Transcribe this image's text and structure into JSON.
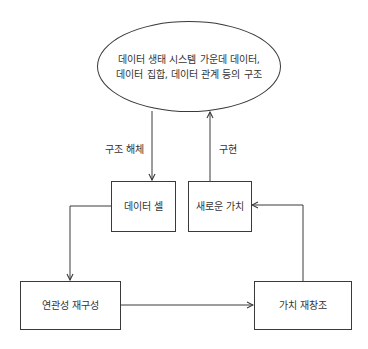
{
  "diagram": {
    "type": "flow",
    "nodes": {
      "ecosystem": {
        "shape": "ellipse",
        "line1": "데이터 생태 시스템 가운데 데이터,",
        "line2": "데이터 집합, 데이터 관계 등의 구조"
      },
      "data_cell": {
        "shape": "rect",
        "label": "데이터 셀"
      },
      "new_value": {
        "shape": "rect",
        "label": "새로운 가치"
      },
      "reconstruct": {
        "shape": "rect",
        "label": "연관성 재구성"
      },
      "value_recreate": {
        "shape": "rect",
        "label": "가치 재창조"
      }
    },
    "edges": [
      {
        "from": "ecosystem",
        "to": "data_cell",
        "label": "구조 해체"
      },
      {
        "from": "new_value",
        "to": "ecosystem",
        "label": "구현"
      },
      {
        "from": "data_cell",
        "to": "reconstruct",
        "label": ""
      },
      {
        "from": "reconstruct",
        "to": "value_recreate",
        "label": ""
      },
      {
        "from": "value_recreate",
        "to": "new_value",
        "label": ""
      }
    ],
    "edge_labels": {
      "deconstruct": "구조 해체",
      "implement": "구현"
    },
    "colors": {
      "stroke": "#3a3a3a",
      "text": "#333333",
      "background": "#ffffff"
    }
  }
}
